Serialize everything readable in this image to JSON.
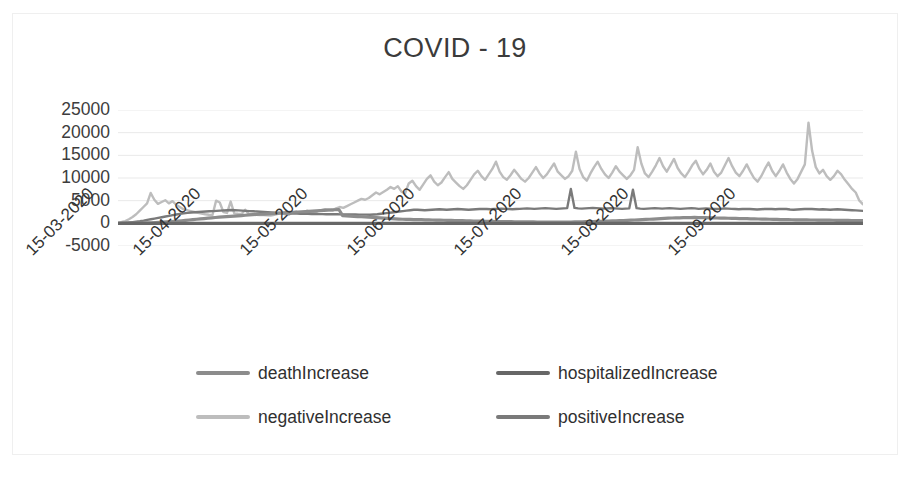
{
  "chart_data": {
    "type": "line",
    "title": "COVID - 19",
    "xlabel": "",
    "ylabel": "",
    "ylim": [
      -5000,
      25000
    ],
    "yticks": [
      25000,
      20000,
      15000,
      10000,
      5000,
      0,
      -5000
    ],
    "ytick_labels": [
      "25000",
      "20000",
      "15000",
      "10000",
      "5000",
      "0",
      "-5000"
    ],
    "xticks": [
      "15-03-2020",
      "15-04-2020",
      "15-05-2020",
      "15-06-2020",
      "15-07-2020",
      "15-08-2020",
      "15-09-2020"
    ],
    "grid": true,
    "legend_position": "bottom",
    "x_start": "15-03-2020",
    "x_end": "30-09-2020",
    "series": [
      {
        "name": "deathIncrease",
        "color": "#8c8c8c",
        "values": [
          20,
          25,
          30,
          35,
          45,
          55,
          70,
          90,
          110,
          130,
          160,
          200,
          250,
          300,
          360,
          430,
          500,
          560,
          640,
          730,
          820,
          900,
          980,
          1050,
          1130,
          1200,
          1280,
          1350,
          1420,
          1480,
          1540,
          1600,
          1660,
          1720,
          1790,
          1850,
          1900,
          1950,
          2000,
          2050,
          2100,
          2150,
          2200,
          2250,
          2300,
          2350,
          2400,
          2450,
          2500,
          2550,
          2600,
          2650,
          2700,
          2750,
          2800,
          2850,
          2900,
          2950,
          3000,
          3050,
          1700,
          1650,
          1600,
          1550,
          1500,
          1450,
          1400,
          1350,
          1300,
          1250,
          1200,
          1150,
          1100,
          1050,
          1000,
          950,
          900,
          880,
          860,
          840,
          820,
          800,
          780,
          760,
          740,
          720,
          700,
          680,
          660,
          640,
          620,
          600,
          580,
          560,
          540,
          520,
          500,
          480,
          460,
          440,
          420,
          400,
          390,
          380,
          370,
          360,
          350,
          340,
          330,
          320,
          310,
          300,
          290,
          280,
          270,
          260,
          250,
          250,
          260,
          270,
          280,
          290,
          300,
          320,
          340,
          360,
          380,
          400,
          420,
          450,
          480,
          510,
          540,
          570,
          600,
          630,
          660,
          700,
          740,
          780,
          820,
          860,
          900,
          950,
          1000,
          1050,
          1100,
          1150,
          1180,
          1200,
          1220,
          1240,
          1260,
          1280,
          1300,
          1280,
          1260,
          1240,
          1220,
          1200,
          1180,
          1160,
          1140,
          1120,
          1100,
          1080,
          1060,
          1040,
          1020,
          1000,
          980,
          960,
          940,
          920,
          900,
          880,
          860,
          840,
          820,
          800,
          790,
          780,
          770,
          760,
          750,
          740,
          730,
          720,
          710,
          700,
          690,
          680,
          670,
          660,
          650,
          640,
          630,
          620,
          610,
          600
        ]
      },
      {
        "name": "hospitalizedIncrease",
        "color": "#676767",
        "values": [
          0,
          0,
          0,
          0,
          0,
          0,
          0,
          0,
          0,
          0,
          0,
          0,
          0,
          0,
          0,
          0,
          0,
          0,
          0,
          0,
          0,
          0,
          0,
          0,
          0,
          0,
          0,
          0,
          0,
          0,
          0,
          0,
          0,
          0,
          0,
          0,
          0,
          0,
          0,
          0,
          0,
          0,
          0,
          0,
          0,
          0,
          0,
          0,
          0,
          0,
          0,
          0,
          0,
          0,
          0,
          0,
          0,
          0,
          0,
          0,
          0,
          0,
          0,
          0,
          0,
          0,
          0,
          0,
          0,
          0,
          0,
          0,
          0,
          0,
          0,
          0,
          0,
          0,
          0,
          0,
          0,
          0,
          0,
          0,
          0,
          0,
          0,
          0,
          0,
          0,
          0,
          0,
          0,
          0,
          0,
          0,
          0,
          0,
          0,
          0,
          0,
          0,
          0,
          0,
          0,
          0,
          0,
          0,
          0,
          0,
          0,
          0,
          0,
          0,
          0,
          0,
          0,
          0,
          0,
          0,
          0,
          0,
          0,
          0,
          0,
          0,
          0,
          0,
          0,
          0,
          0,
          0,
          0,
          0,
          0,
          0,
          0,
          0,
          0,
          0,
          0,
          0,
          0,
          0,
          0,
          0,
          0,
          0,
          0,
          0,
          0,
          0,
          0,
          0,
          0,
          0,
          0,
          0,
          0,
          0,
          0,
          0,
          0,
          0,
          0,
          0,
          0,
          0,
          0,
          0,
          0,
          0,
          0,
          0,
          0,
          0,
          0,
          0,
          0,
          0,
          0,
          0,
          0,
          0,
          0,
          0,
          0,
          0,
          0,
          0,
          0,
          0,
          0,
          0,
          0,
          0,
          0,
          0,
          0,
          0,
          0,
          0
        ]
      },
      {
        "name": "negativeIncrease",
        "color": "#bdbdbd",
        "values": [
          150,
          300,
          500,
          900,
          1400,
          2000,
          2800,
          3600,
          4400,
          6700,
          5200,
          4300,
          4700,
          5100,
          4400,
          4900,
          4100,
          3600,
          3100,
          2900,
          2700,
          2500,
          2300,
          2150,
          2000,
          1900,
          1850,
          5000,
          4600,
          2500,
          2300,
          4800,
          2200,
          2100,
          2050,
          3000,
          2000,
          1950,
          1900,
          1850,
          1800,
          1750,
          1700,
          1900,
          2100,
          2300,
          2000,
          1900,
          2400,
          2600,
          2200,
          2100,
          2800,
          2500,
          2300,
          2700,
          2900,
          3100,
          3000,
          2800,
          3300,
          3600,
          3400,
          3800,
          4200,
          4600,
          5000,
          5400,
          5200,
          5600,
          6200,
          6800,
          6400,
          6900,
          7400,
          8000,
          7600,
          8200,
          7000,
          6600,
          8800,
          9400,
          8200,
          7400,
          8600,
          9800,
          10600,
          9200,
          8400,
          9000,
          10200,
          11300,
          9800,
          9000,
          8200,
          7600,
          8400,
          9600,
          10800,
          11600,
          10400,
          9600,
          10800,
          12000,
          13600,
          11400,
          10200,
          9600,
          10600,
          11800,
          10800,
          9800,
          9200,
          10000,
          11200,
          12400,
          11000,
          10000,
          10800,
          12000,
          13200,
          11400,
          10600,
          9800,
          10400,
          11600,
          15800,
          12000,
          10200,
          9400,
          11000,
          12400,
          13600,
          12000,
          10800,
          10000,
          11200,
          12600,
          11400,
          10600,
          9800,
          10600,
          11800,
          16800,
          13200,
          11000,
          10200,
          11400,
          12800,
          14400,
          12600,
          11400,
          12800,
          14200,
          12200,
          11000,
          10200,
          11400,
          12800,
          13800,
          12000,
          10800,
          11800,
          13200,
          11400,
          10400,
          11200,
          12800,
          14400,
          12600,
          11200,
          10400,
          11600,
          13000,
          11400,
          10000,
          9200,
          10400,
          12000,
          13400,
          11600,
          10400,
          11600,
          13000,
          11200,
          9800,
          8800,
          9800,
          11400,
          13000,
          22200,
          16000,
          12400,
          11000,
          11800,
          10400,
          9600,
          10400,
          11600,
          10800,
          9600,
          8600,
          7600,
          6800,
          5000,
          4200
        ]
      },
      {
        "name": "positiveIncrease",
        "color": "#7a7a7a",
        "values": [
          30,
          60,
          110,
          180,
          260,
          360,
          470,
          600,
          750,
          900,
          1050,
          1200,
          1350,
          1500,
          1650,
          1800,
          1950,
          2100,
          2200,
          2300,
          2400,
          2450,
          2500,
          2550,
          2600,
          2650,
          2700,
          2750,
          2800,
          2850,
          2900,
          2950,
          2900,
          2850,
          2800,
          2750,
          2700,
          2650,
          2600,
          2550,
          2500,
          2450,
          2400,
          2350,
          2300,
          2250,
          2200,
          2180,
          2160,
          2140,
          2120,
          2100,
          2080,
          2060,
          2050,
          2040,
          2030,
          2020,
          2010,
          2000,
          1990,
          1980,
          1970,
          1960,
          1950,
          1940,
          1930,
          1920,
          1910,
          1900,
          1950,
          2000,
          2100,
          2200,
          2300,
          2400,
          2500,
          2600,
          2700,
          2800,
          2900,
          3000,
          3000,
          2950,
          2900,
          2950,
          3000,
          3050,
          3100,
          3050,
          3000,
          3050,
          3100,
          3150,
          3100,
          3050,
          3000,
          3050,
          3100,
          3150,
          3200,
          3150,
          3100,
          3150,
          3200,
          3250,
          3200,
          3150,
          3100,
          3150,
          3200,
          3250,
          3300,
          3250,
          3200,
          3250,
          3300,
          3350,
          3300,
          3250,
          3200,
          3250,
          3300,
          3350,
          7600,
          3400,
          3300,
          3250,
          3300,
          3350,
          3400,
          3350,
          3300,
          3250,
          3300,
          3350,
          3300,
          3250,
          3200,
          3250,
          3300,
          7400,
          3350,
          3250,
          3200,
          3250,
          3300,
          3350,
          3300,
          3250,
          3300,
          3350,
          3300,
          3250,
          3200,
          3250,
          3300,
          3350,
          3300,
          3200,
          3250,
          3300,
          3250,
          3200,
          3150,
          3200,
          3300,
          3250,
          3200,
          3150,
          3100,
          3150,
          3200,
          3150,
          3100,
          3050,
          3100,
          3150,
          3200,
          3150,
          3100,
          3150,
          3200,
          3150,
          3050,
          3000,
          3050,
          3100,
          3150,
          3200,
          3150,
          3100,
          3050,
          3100,
          3050,
          3000,
          3050,
          3100,
          3050,
          3000,
          2950,
          2900,
          2850,
          2800,
          2750
        ]
      }
    ]
  },
  "axis": {
    "y_tick_labels": [
      "25000",
      "20000",
      "15000",
      "10000",
      "5000",
      "0",
      "-5000"
    ],
    "x_tick_labels": [
      "15-03-2020",
      "15-04-2020",
      "15-05-2020",
      "15-06-2020",
      "15-07-2020",
      "15-08-2020",
      "15-09-2020"
    ]
  },
  "legend": {
    "items": [
      {
        "label": "deathIncrease",
        "color": "#8c8c8c"
      },
      {
        "label": "hospitalizedIncrease",
        "color": "#676767"
      },
      {
        "label": "negativeIncrease",
        "color": "#bdbdbd"
      },
      {
        "label": "positiveIncrease",
        "color": "#7a7a7a"
      }
    ]
  }
}
